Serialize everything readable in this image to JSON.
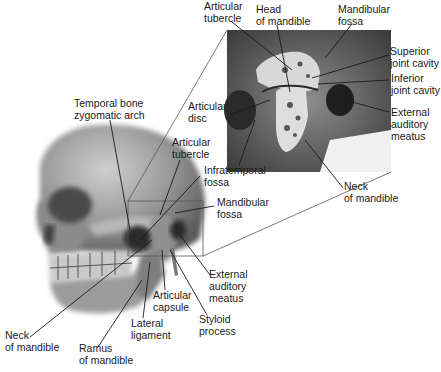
{
  "diagram": {
    "labels": [
      {
        "id": "inset-articular-tubercle",
        "text": "Articular\ntubercle",
        "x": 204,
        "y": 0
      },
      {
        "id": "inset-head-of-mandible",
        "text": "Head\nof mandible",
        "x": 256,
        "y": 3
      },
      {
        "id": "inset-mandibular-fossa",
        "text": "Mandibular\nfossa",
        "x": 338,
        "y": 3
      },
      {
        "id": "inset-superior-joint-cavity",
        "text": "Superior\njoint cavity",
        "x": 390,
        "y": 45
      },
      {
        "id": "inset-inferior-joint-cavity",
        "text": "Inferior\njoint cavity",
        "x": 391,
        "y": 72
      },
      {
        "id": "inset-articular-disc",
        "text": "Articular\ndisc",
        "x": 188,
        "y": 100
      },
      {
        "id": "inset-external-auditory-meatus",
        "text": "External\nauditory\nmeatus",
        "x": 391,
        "y": 106
      },
      {
        "id": "inset-neck-of-mandible",
        "text": "Neck\nof mandible",
        "x": 344,
        "y": 180
      },
      {
        "id": "temporal-bone-zygomatic-arch",
        "text": "Temporal bone\nzygomatic arch",
        "x": 74,
        "y": 97
      },
      {
        "id": "articular-tubercle",
        "text": "Articular\ntubercle",
        "x": 172,
        "y": 136
      },
      {
        "id": "infratemporal-fosssa",
        "text": "Infratemporal\nfossa",
        "x": 204,
        "y": 164
      },
      {
        "id": "mandibular-fossa",
        "text": "Mandibular\nfossa",
        "x": 217,
        "y": 196
      },
      {
        "id": "external-auditory-meatus",
        "text": "External\nauditory\nmeatus",
        "x": 209,
        "y": 268
      },
      {
        "id": "articular-capsule",
        "text": "Articular\ncapsule",
        "x": 153,
        "y": 289
      },
      {
        "id": "styloid-process",
        "text": "Styloid\nprocess",
        "x": 199,
        "y": 313
      },
      {
        "id": "lateral-ligament",
        "text": "Lateral\nligament",
        "x": 131,
        "y": 317
      },
      {
        "id": "neck-of-mandible",
        "text": "Neck\nof mandible",
        "x": 5,
        "y": 329
      },
      {
        "id": "ramus-of-mandible",
        "text": "Ramus\nof mandible",
        "x": 79,
        "y": 342
      }
    ]
  }
}
